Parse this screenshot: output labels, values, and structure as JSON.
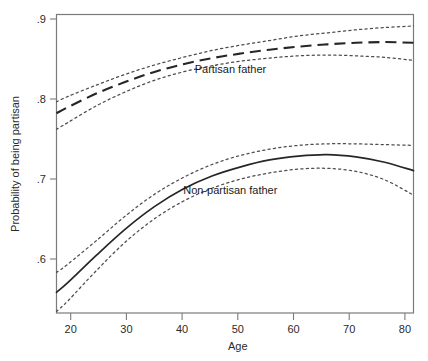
{
  "chart_data": {
    "type": "line",
    "title": "",
    "subtitle": "",
    "xlabel": "Age",
    "ylabel": "Probability of being partisan",
    "xlim": [
      18,
      80
    ],
    "ylim": [
      0.525,
      0.915
    ],
    "grid": false,
    "legend_position": "inline-annotations",
    "x_ticks": [
      "20",
      "30",
      "40",
      "50",
      "60",
      "70",
      "80"
    ],
    "x_tick_values": [
      20,
      30,
      40,
      50,
      60,
      70,
      80
    ],
    "y_ticks": [
      ".9",
      ".8",
      ".7",
      ".6"
    ],
    "y_tick_values": [
      0.9,
      0.8,
      0.7,
      0.6
    ],
    "annotations": [
      {
        "text": "Partisan father",
        "x": 42,
        "y": 0.838
      },
      {
        "text": "Non-partisan father",
        "x": 40,
        "y": 0.68
      }
    ],
    "x": [
      18,
      20,
      25,
      30,
      35,
      40,
      45,
      50,
      55,
      60,
      65,
      70,
      75,
      80
    ],
    "series": [
      {
        "name": "Partisan father",
        "style": "dashed",
        "values": [
          0.786,
          0.794,
          0.812,
          0.827,
          0.84,
          0.85,
          0.858,
          0.864,
          0.869,
          0.873,
          0.876,
          0.878,
          0.879,
          0.878
        ]
      },
      {
        "name": "Partisan father upper 95% CI",
        "style": "dotted",
        "values": [
          0.801,
          0.808,
          0.823,
          0.837,
          0.849,
          0.859,
          0.868,
          0.875,
          0.881,
          0.887,
          0.891,
          0.895,
          0.898,
          0.9
        ]
      },
      {
        "name": "Partisan father lower 95% CI",
        "style": "dotted",
        "values": [
          0.765,
          0.774,
          0.796,
          0.814,
          0.829,
          0.84,
          0.848,
          0.854,
          0.858,
          0.861,
          0.862,
          0.861,
          0.859,
          0.855
        ]
      },
      {
        "name": "Non-partisan father",
        "style": "solid",
        "values": [
          0.552,
          0.565,
          0.601,
          0.635,
          0.664,
          0.687,
          0.704,
          0.716,
          0.725,
          0.73,
          0.732,
          0.729,
          0.722,
          0.711
        ]
      },
      {
        "name": "Non-partisan father upper 95% CI",
        "style": "dotted",
        "values": [
          0.578,
          0.589,
          0.62,
          0.652,
          0.68,
          0.702,
          0.719,
          0.731,
          0.739,
          0.744,
          0.746,
          0.746,
          0.745,
          0.744
        ]
      },
      {
        "name": "Non-partisan father lower 95% CI",
        "style": "dotted",
        "values": [
          0.527,
          0.541,
          0.581,
          0.618,
          0.648,
          0.671,
          0.688,
          0.7,
          0.708,
          0.713,
          0.714,
          0.71,
          0.699,
          0.679
        ]
      }
    ]
  },
  "colors": {
    "background": "#ffffff",
    "frame": "#7a7a7a",
    "curve_main": "#262626",
    "curve_ci": "#4d4d4d",
    "text": "#1a1a1a"
  }
}
